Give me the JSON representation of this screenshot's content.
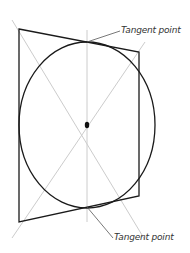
{
  "diagram": {
    "labels": {
      "top": "Tangent point",
      "bottom": "Tangent point"
    },
    "colors": {
      "outline": "#1a1a1a",
      "guide": "#c8c8c8"
    }
  }
}
